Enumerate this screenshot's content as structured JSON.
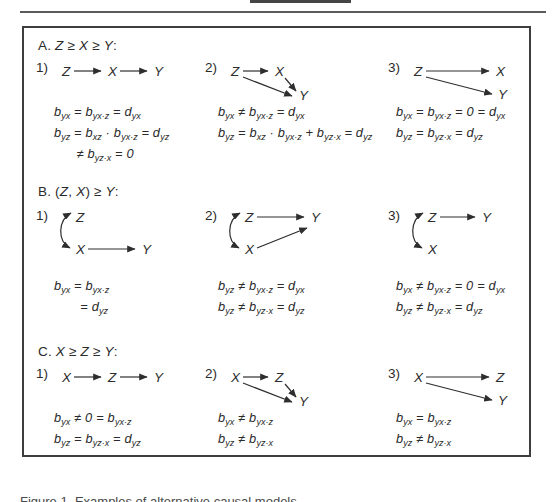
{
  "caption": "Figure 1. Examples of alternative causal models",
  "figure": {
    "panels": [
      {
        "label": "A. {Z} ≥ {X} ≥ {Y}:",
        "items": [
          {
            "num": "1)",
            "diagram": {
              "w": 150,
              "h": 50,
              "nodes": [
                [
                  "Z",
                  6,
                  18
                ],
                [
                  "X",
                  52,
                  18
                ],
                [
                  "Y",
                  98,
                  18
                ]
              ],
              "arrows": [
                [
                  18,
                  13,
                  45,
                  13
                ],
                [
                  64,
                  13,
                  91,
                  13
                ]
              ]
            },
            "equations": [
              "b[yx] = b[yx·z] = d[yx]",
              "b[yz] = b[xz] · b[yx·z]  = d[yz]",
              "      ≠ b[yz·x] = 0"
            ]
          },
          {
            "num": "2)",
            "diagram": {
              "w": 150,
              "h": 50,
              "nodes": [
                [
                  "Z",
                  6,
                  18
                ],
                [
                  "X",
                  50,
                  18
                ],
                [
                  "Y",
                  74,
                  42
                ]
              ],
              "arrows": [
                [
                  18,
                  13,
                  43,
                  13
                ],
                [
                  60,
                  20,
                  71,
                  33
                ],
                [
                  18,
                  19,
                  67,
                  38
                ]
              ]
            },
            "equations": [
              "b[yx] ≠ b[yx·z] = d[yx]",
              "b[yz] = b[xz] · b[yx·z] + b[yz·x] = d[yz]"
            ]
          },
          {
            "num": "3)",
            "diagram": {
              "w": 150,
              "h": 50,
              "nodes": [
                [
                  "Z",
                  6,
                  18
                ],
                [
                  "X",
                  88,
                  18
                ],
                [
                  "Y",
                  90,
                  41
                ]
              ],
              "arrows": [
                [
                  18,
                  13,
                  81,
                  13
                ],
                [
                  18,
                  19,
                  84,
                  36
                ]
              ]
            },
            "equations": [
              "b[yx] = b[yx·z] = 0 = d[yx]",
              "b[yz] = b[yz·x]  = d[yz]"
            ]
          }
        ]
      },
      {
        "label": "B. ({Z}, {X}) ≥ {Y}:",
        "items": [
          {
            "num": "1)",
            "diagram": {
              "w": 150,
              "h": 60,
              "nodes": [
                [
                  "Z",
                  20,
                  16
                ],
                [
                  "X",
                  20,
                  48
                ],
                [
                  "Y",
                  86,
                  48
                ]
              ],
              "arrows": [
                [
                  32,
                  43,
                  79,
                  43
                ]
              ],
              "corr": [
                15,
                7,
                14,
                42
              ]
            },
            "equations": [
              "b[yx] = b[yx·z]",
              "       = d[yz]"
            ]
          },
          {
            "num": "2)",
            "diagram": {
              "w": 150,
              "h": 60,
              "nodes": [
                [
                  "Z",
                  20,
                  16
                ],
                [
                  "Y",
                  86,
                  16
                ],
                [
                  "X",
                  20,
                  48
                ]
              ],
              "arrows": [
                [
                  32,
                  11,
                  79,
                  11
                ],
                [
                  32,
                  42,
                  82,
                  22
                ]
              ],
              "corr": [
                15,
                7,
                14,
                42
              ]
            },
            "equations": [
              "b[yz] ≠ b[yx·z] = d[yx]",
              "b[yz] ≠ b[yz·x] = d[yz]"
            ]
          },
          {
            "num": "3)",
            "diagram": {
              "w": 150,
              "h": 60,
              "nodes": [
                [
                  "Z",
                  20,
                  16
                ],
                [
                  "Y",
                  74,
                  16
                ],
                [
                  "X",
                  20,
                  48
                ]
              ],
              "arrows": [
                [
                  32,
                  11,
                  67,
                  11
                ]
              ],
              "corr": [
                15,
                7,
                14,
                42
              ]
            },
            "equations": [
              "b[yx] ≠ b[yx·z] = 0 = d[yx]",
              "b[yz] ≠ b[yz·x] = d[yz]"
            ]
          }
        ]
      },
      {
        "label": "C. {X} ≥ {Z} ≥ {Y}:",
        "items": [
          {
            "num": "1)",
            "diagram": {
              "w": 150,
              "h": 50,
              "nodes": [
                [
                  "X",
                  6,
                  18
                ],
                [
                  "Z",
                  52,
                  18
                ],
                [
                  "Y",
                  98,
                  18
                ]
              ],
              "arrows": [
                [
                  18,
                  13,
                  45,
                  13
                ],
                [
                  64,
                  13,
                  91,
                  13
                ]
              ]
            },
            "equations": [
              "b[yx] ≠ 0 = b[yx·z]",
              "b[yz] = b[yz·x]  = d[yz]"
            ]
          },
          {
            "num": "2)",
            "diagram": {
              "w": 150,
              "h": 50,
              "nodes": [
                [
                  "X",
                  6,
                  18
                ],
                [
                  "Z",
                  50,
                  18
                ],
                [
                  "Y",
                  74,
                  42
                ]
              ],
              "arrows": [
                [
                  18,
                  13,
                  43,
                  13
                ],
                [
                  60,
                  20,
                  71,
                  33
                ],
                [
                  18,
                  19,
                  67,
                  38
                ]
              ]
            },
            "equations": [
              "b[yx] ≠ b[yx·z]",
              "b[yz] ≠ b[yz·x]"
            ]
          },
          {
            "num": "3)",
            "diagram": {
              "w": 150,
              "h": 50,
              "nodes": [
                [
                  "X",
                  6,
                  18
                ],
                [
                  "Z",
                  88,
                  18
                ],
                [
                  "Y",
                  90,
                  41
                ]
              ],
              "arrows": [
                [
                  18,
                  13,
                  81,
                  13
                ],
                [
                  18,
                  19,
                  84,
                  36
                ]
              ]
            },
            "equations": [
              "b[yx] = b[yx·z]",
              "b[yz] ≠ b[yz·x]"
            ]
          }
        ]
      }
    ]
  }
}
